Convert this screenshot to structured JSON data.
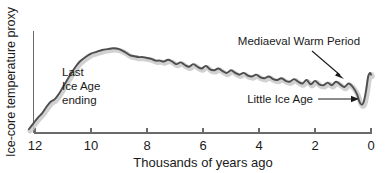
{
  "chart_data": {
    "type": "line",
    "title": "",
    "xlabel": "Thousands of years ago",
    "ylabel": "Ice-core temperature proxy",
    "xlim": [
      12,
      0
    ],
    "ylim": [
      0,
      1
    ],
    "x_ticks": [
      "12",
      "10",
      "8",
      "6",
      "4",
      "2",
      "0"
    ],
    "x_tick_values": [
      12,
      10,
      8,
      6,
      4,
      2,
      0
    ],
    "y_ticks": [],
    "grid": false,
    "legend": "none",
    "x_direction": "reversed",
    "series": [
      {
        "name": "Ice-core temperature proxy",
        "line_color": "#4e4e4e",
        "halo_color": "#c9c9c9",
        "x": [
          12.22,
          12.05,
          11.9,
          11.75,
          11.6,
          11.45,
          11.3,
          11.15,
          11.0,
          10.85,
          10.7,
          10.55,
          10.4,
          10.2,
          10.0,
          9.8,
          9.6,
          9.4,
          9.2,
          9.0,
          8.8,
          8.6,
          8.45,
          8.3,
          8.15,
          8.0,
          7.85,
          7.7,
          7.55,
          7.4,
          7.25,
          7.1,
          6.95,
          6.8,
          6.65,
          6.5,
          6.35,
          6.2,
          6.05,
          5.9,
          5.75,
          5.6,
          5.45,
          5.3,
          5.15,
          5.0,
          4.85,
          4.7,
          4.55,
          4.4,
          4.25,
          4.1,
          3.95,
          3.8,
          3.65,
          3.5,
          3.35,
          3.2,
          3.05,
          2.9,
          2.75,
          2.6,
          2.45,
          2.3,
          2.15,
          2.0,
          1.85,
          1.7,
          1.55,
          1.4,
          1.25,
          1.1,
          0.95,
          0.8,
          0.65,
          0.5,
          0.42,
          0.34,
          0.26,
          0.18,
          0.1,
          0.04,
          0.0
        ],
        "y": [
          0.02,
          0.09,
          0.15,
          0.2,
          0.27,
          0.33,
          0.36,
          0.42,
          0.5,
          0.58,
          0.66,
          0.73,
          0.79,
          0.84,
          0.88,
          0.9,
          0.92,
          0.93,
          0.94,
          0.93,
          0.9,
          0.86,
          0.85,
          0.84,
          0.84,
          0.83,
          0.82,
          0.8,
          0.8,
          0.79,
          0.81,
          0.79,
          0.76,
          0.78,
          0.75,
          0.73,
          0.76,
          0.73,
          0.71,
          0.74,
          0.7,
          0.69,
          0.71,
          0.68,
          0.66,
          0.69,
          0.66,
          0.64,
          0.66,
          0.63,
          0.62,
          0.64,
          0.61,
          0.6,
          0.62,
          0.59,
          0.58,
          0.6,
          0.57,
          0.56,
          0.59,
          0.56,
          0.54,
          0.58,
          0.53,
          0.57,
          0.53,
          0.52,
          0.55,
          0.52,
          0.56,
          0.53,
          0.5,
          0.54,
          0.5,
          0.42,
          0.34,
          0.3,
          0.33,
          0.45,
          0.62,
          0.66,
          0.64
        ]
      }
    ],
    "annotations": [
      {
        "id": "last-ice-age-ending",
        "lines": [
          "Last",
          "Ice Age",
          "ending"
        ],
        "x_px": 62,
        "y_px": 74,
        "align": "start",
        "arrow": false
      },
      {
        "id": "mediaeval-warm-period",
        "lines": [
          "Mediaeval Warm Period"
        ],
        "x_px": 299,
        "y_px": 45,
        "align": "middle",
        "arrow": true,
        "arrow_from": [
          314,
          51
        ],
        "arrow_to": [
          343,
          77
        ]
      },
      {
        "id": "little-ice-age",
        "lines": [
          "Little Ice Age"
        ],
        "x_px": 313,
        "y_px": 103,
        "align": "end",
        "arrow": true,
        "arrow_from": [
          318,
          99
        ],
        "arrow_to": [
          357,
          99
        ]
      }
    ]
  },
  "axes": {
    "x_title": "Thousands of years ago",
    "y_title": "Ice-core temperature proxy"
  }
}
